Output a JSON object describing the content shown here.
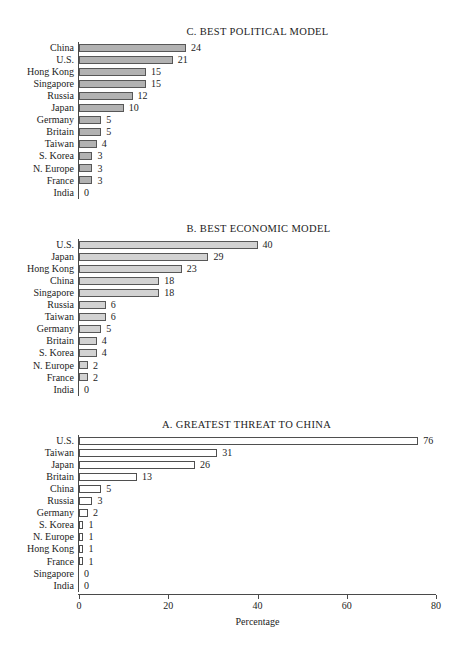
{
  "figure": {
    "width": 459,
    "height": 663,
    "background": "#ffffff"
  },
  "axis": {
    "xlabel": "Percentage",
    "ticks": [
      "0",
      "20",
      "40",
      "60",
      "80"
    ],
    "tick_values": [
      0,
      20,
      40,
      60,
      80
    ],
    "xmin": 0,
    "xmax": 80
  },
  "panels": [
    {
      "id": "C",
      "title": "C. BEST POLITICAL MODEL",
      "fill_color": "#b2b2b2",
      "border_color": "#575757",
      "categories": [
        "China",
        "U.S.",
        "Hong Kong",
        "Singapore",
        "Russia",
        "Japan",
        "Germany",
        "Britain",
        "Taiwan",
        "S. Korea",
        "N. Europe",
        "France",
        "India"
      ],
      "values": [
        24,
        21,
        15,
        15,
        12,
        10,
        5,
        5,
        4,
        3,
        3,
        3,
        0
      ],
      "labels": [
        "24",
        "21",
        "15",
        "15",
        "12",
        "10",
        "5",
        "5",
        "4",
        "3",
        "3",
        "3",
        "0"
      ]
    },
    {
      "id": "B",
      "title": "B. BEST ECONOMIC MODEL",
      "fill_color": "#d2d2d2",
      "border_color": "#575757",
      "categories": [
        "U.S.",
        "Japan",
        "Hong Kong",
        "China",
        "Singapore",
        "Russia",
        "Taiwan",
        "Germany",
        "Britain",
        "S. Korea",
        "N. Europe",
        "France",
        "India"
      ],
      "values": [
        40,
        29,
        23,
        18,
        18,
        6,
        6,
        5,
        4,
        4,
        2,
        2,
        0
      ],
      "labels": [
        "40",
        "29",
        "23",
        "18",
        "18",
        "6",
        "6",
        "5",
        "4",
        "4",
        "2",
        "2",
        "0"
      ]
    },
    {
      "id": "A",
      "title": "A. GREATEST THREAT TO CHINA",
      "fill_color": "#ffffff",
      "border_color": "#4f4f4f",
      "categories": [
        "U.S.",
        "Taiwan",
        "Japan",
        "Britain",
        "China",
        "Russia",
        "Germany",
        "S. Korea",
        "N. Europe",
        "Hong Kong",
        "France",
        "Singapore",
        "India"
      ],
      "values": [
        76,
        31,
        26,
        13,
        5,
        3,
        2,
        1,
        1,
        1,
        1,
        0,
        0
      ],
      "labels": [
        "76",
        "31",
        "26",
        "13",
        "5",
        "3",
        "2",
        "1",
        "1",
        "1",
        "1",
        "0",
        "0"
      ]
    }
  ],
  "chart_data": [
    {
      "type": "bar",
      "orientation": "horizontal",
      "title": "C. BEST POLITICAL MODEL",
      "xlabel": "Percentage",
      "ylabel": "",
      "xlim": [
        0,
        80
      ],
      "grid": false,
      "legend": "none",
      "categories": [
        "China",
        "U.S.",
        "Hong Kong",
        "Singapore",
        "Russia",
        "Japan",
        "Germany",
        "Britain",
        "Taiwan",
        "S. Korea",
        "N. Europe",
        "France",
        "India"
      ],
      "values": [
        24,
        21,
        15,
        15,
        12,
        10,
        5,
        5,
        4,
        3,
        3,
        3,
        0
      ]
    },
    {
      "type": "bar",
      "orientation": "horizontal",
      "title": "B. BEST ECONOMIC MODEL",
      "xlabel": "Percentage",
      "ylabel": "",
      "xlim": [
        0,
        80
      ],
      "grid": false,
      "legend": "none",
      "categories": [
        "U.S.",
        "Japan",
        "Hong Kong",
        "China",
        "Singapore",
        "Russia",
        "Taiwan",
        "Germany",
        "Britain",
        "S. Korea",
        "N. Europe",
        "France",
        "India"
      ],
      "values": [
        40,
        29,
        23,
        18,
        18,
        6,
        6,
        5,
        4,
        4,
        2,
        2,
        0
      ]
    },
    {
      "type": "bar",
      "orientation": "horizontal",
      "title": "A. GREATEST THREAT TO CHINA",
      "xlabel": "Percentage",
      "ylabel": "",
      "xlim": [
        0,
        80
      ],
      "grid": false,
      "legend": "none",
      "categories": [
        "U.S.",
        "Taiwan",
        "Japan",
        "Britain",
        "China",
        "Russia",
        "Germany",
        "S. Korea",
        "N. Europe",
        "Hong Kong",
        "France",
        "Singapore",
        "India"
      ],
      "values": [
        76,
        31,
        26,
        13,
        5,
        3,
        2,
        1,
        1,
        1,
        1,
        0,
        0
      ]
    }
  ]
}
